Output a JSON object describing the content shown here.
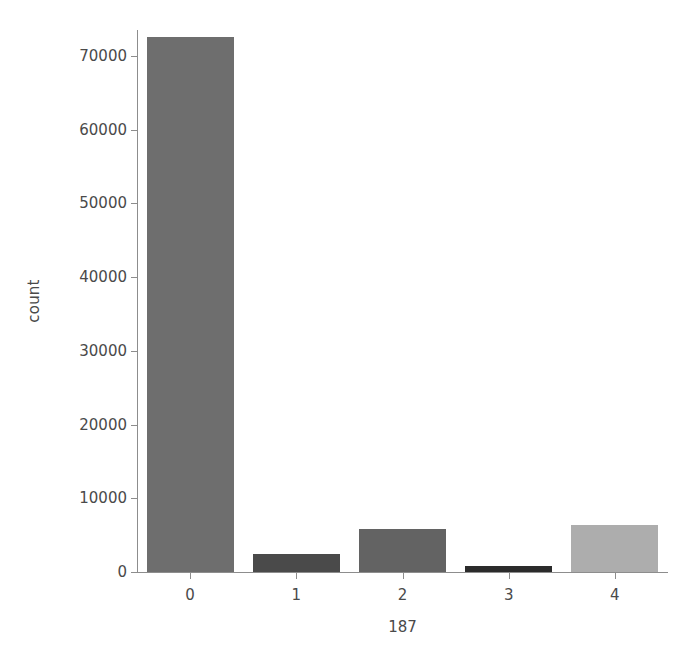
{
  "chart_data": {
    "type": "bar",
    "title": "",
    "subtitle": "",
    "xlabel": "187",
    "ylabel": "count",
    "categories": [
      "0",
      "1",
      "2",
      "3",
      "4"
    ],
    "values": [
      72500,
      2400,
      5900,
      800,
      6350
    ],
    "series": [
      {
        "name": "count",
        "values": [
          72500,
          2400,
          5900,
          800,
          6350
        ]
      }
    ],
    "bar_colors": [
      "#6e6e6e",
      "#4a4a4a",
      "#636363",
      "#2b2b2b",
      "#adadad"
    ],
    "ylim": [
      0,
      73500
    ],
    "yticks": [
      0,
      10000,
      20000,
      30000,
      40000,
      50000,
      60000,
      70000
    ],
    "ytick_labels": [
      "0",
      "10000",
      "20000",
      "30000",
      "40000",
      "50000",
      "60000",
      "70000"
    ],
    "xticks": [
      0,
      1,
      2,
      3,
      4
    ],
    "xtick_labels": [
      "0",
      "1",
      "2",
      "3",
      "4"
    ],
    "grid": false,
    "legend": false,
    "legend_position": "none",
    "axis_color": "#8d8d8d",
    "text_color": "#4a4a4a",
    "background_color": "#ffffff"
  }
}
